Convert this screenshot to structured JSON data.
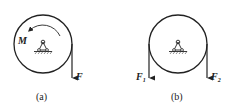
{
  "figures": [
    {
      "id": "a",
      "caption": "(a)",
      "moment_label": "M",
      "force_labels": [
        {
          "main": "F",
          "sub": ""
        }
      ]
    },
    {
      "id": "b",
      "caption": "(b)",
      "force_labels": [
        {
          "main": "F",
          "sub": "1"
        },
        {
          "main": "F",
          "sub": "2"
        }
      ]
    }
  ],
  "colors": {
    "stroke": "#222222",
    "hatch": "#444444"
  }
}
